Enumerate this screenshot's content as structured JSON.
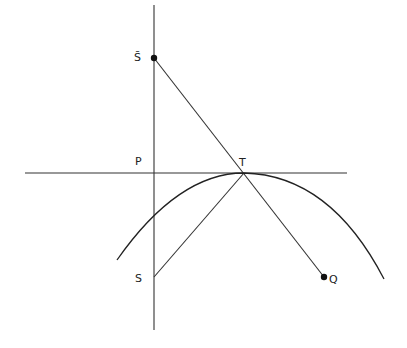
{
  "diagram": {
    "type": "geometry",
    "points": {
      "S_bar": {
        "label": "S̄",
        "x": 154,
        "y": 58,
        "marked": true
      },
      "P": {
        "label": "P",
        "x": 154,
        "y": 173,
        "marked": false
      },
      "T": {
        "label": "T",
        "x": 244,
        "y": 173,
        "marked": false
      },
      "S": {
        "label": "S",
        "x": 154,
        "y": 277,
        "marked": false
      },
      "Q": {
        "label": "Q",
        "x": 324,
        "y": 277,
        "marked": true
      }
    },
    "lines": [
      {
        "name": "vertical-axis",
        "from": [
          154,
          5
        ],
        "to": [
          154,
          330
        ]
      },
      {
        "name": "tangent-line",
        "from": [
          25,
          173
        ],
        "to": [
          347,
          173
        ]
      },
      {
        "name": "segment-sbar-q",
        "from": "S_bar",
        "to": "Q"
      },
      {
        "name": "segment-s-t",
        "from": "S",
        "to": "T"
      }
    ],
    "arc": {
      "start": [
        117,
        260
      ],
      "apex": "T",
      "end": [
        384,
        279
      ]
    },
    "colors": {
      "stroke": "#333333",
      "background": "#ffffff"
    }
  }
}
